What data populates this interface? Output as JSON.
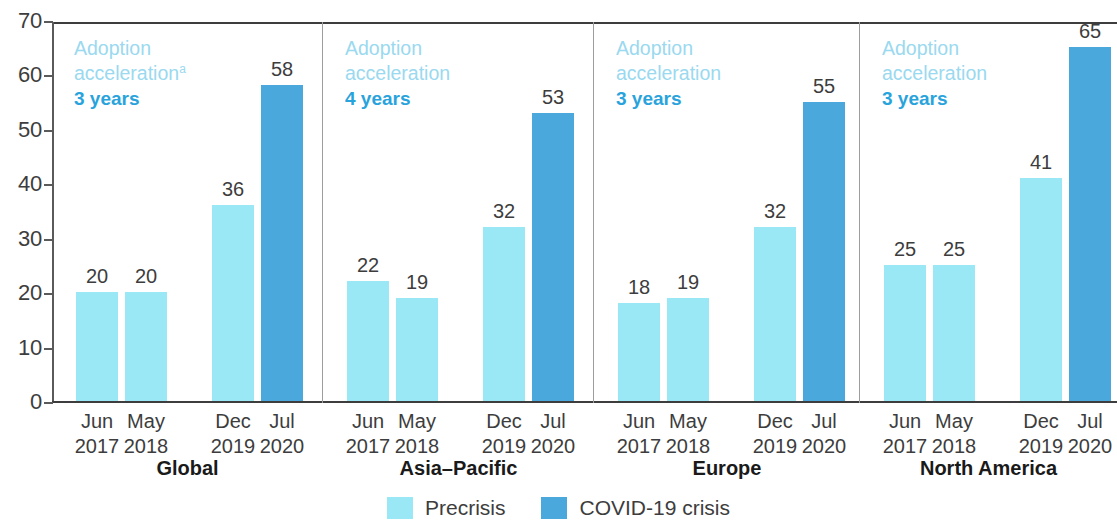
{
  "chart_data": {
    "type": "bar",
    "title": "",
    "xlabel": "",
    "ylabel": "",
    "ylim": [
      0,
      70
    ],
    "ytick_step": 10,
    "yticks": [
      70,
      60,
      50,
      40,
      30,
      20,
      10,
      0
    ],
    "grid": false,
    "legend_position": "bottom-center",
    "categories": [
      "Jun 2017",
      "May 2018",
      "Dec 2019",
      "Jul 2020"
    ],
    "category_lines": [
      [
        "Jun",
        "2017"
      ],
      [
        "May",
        "2018"
      ],
      [
        "Dec",
        "2019"
      ],
      [
        "Jul",
        "2020"
      ]
    ],
    "series": [
      {
        "name": "Precrisis",
        "color": "#9ae8f6"
      },
      {
        "name": "COVID-19 crisis",
        "color": "#4ba8dc"
      }
    ],
    "panels": [
      {
        "name": "Global",
        "accel_title": "Adoption acceleration",
        "accel_title_line1": "Adoption",
        "accel_title_line2": "acceleration",
        "accel_footnote": "a",
        "accel_value": "3 years",
        "bars": [
          {
            "label": "Jun 2017",
            "value": 20,
            "series": "Precrisis"
          },
          {
            "label": "May 2018",
            "value": 20,
            "series": "Precrisis"
          },
          {
            "label": "Dec 2019",
            "value": 36,
            "series": "Precrisis"
          },
          {
            "label": "Jul 2020",
            "value": 58,
            "series": "COVID-19 crisis"
          }
        ]
      },
      {
        "name": "Asia–Pacific",
        "accel_title": "Adoption acceleration",
        "accel_title_line1": "Adoption",
        "accel_title_line2": "acceleration",
        "accel_footnote": "",
        "accel_value": "4 years",
        "bars": [
          {
            "label": "Jun 2017",
            "value": 22,
            "series": "Precrisis"
          },
          {
            "label": "May 2018",
            "value": 19,
            "series": "Precrisis"
          },
          {
            "label": "Dec 2019",
            "value": 32,
            "series": "Precrisis"
          },
          {
            "label": "Jul 2020",
            "value": 53,
            "series": "COVID-19 crisis"
          }
        ]
      },
      {
        "name": "Europe",
        "accel_title": "Adoption acceleration",
        "accel_title_line1": "Adoption",
        "accel_title_line2": "acceleration",
        "accel_footnote": "",
        "accel_value": "3 years",
        "bars": [
          {
            "label": "Jun 2017",
            "value": 18,
            "series": "Precrisis"
          },
          {
            "label": "May 2018",
            "value": 19,
            "series": "Precrisis"
          },
          {
            "label": "Dec 2019",
            "value": 32,
            "series": "Precrisis"
          },
          {
            "label": "Jul 2020",
            "value": 55,
            "series": "COVID-19 crisis"
          }
        ]
      },
      {
        "name": "North America",
        "accel_title": "Adoption acceleration",
        "accel_title_line1": "Adoption",
        "accel_title_line2": "acceleration",
        "accel_footnote": "",
        "accel_value": "3 years",
        "bars": [
          {
            "label": "Jun 2017",
            "value": 25,
            "series": "Precrisis"
          },
          {
            "label": "May 2018",
            "value": 25,
            "series": "Precrisis"
          },
          {
            "label": "Dec 2019",
            "value": 41,
            "series": "Precrisis"
          },
          {
            "label": "Jul 2020",
            "value": 65,
            "series": "COVID-19 crisis"
          }
        ]
      }
    ],
    "legend": [
      {
        "label": "Precrisis",
        "color": "#9ae8f6"
      },
      {
        "label": "COVID-19 crisis",
        "color": "#4ba8dc"
      }
    ],
    "colors": {
      "precrisis": "#9ae8f6",
      "covid": "#4ba8dc",
      "accel_title": "#9ad9ef",
      "accel_value": "#29a3dc",
      "axis": "#3d3d3d"
    }
  }
}
